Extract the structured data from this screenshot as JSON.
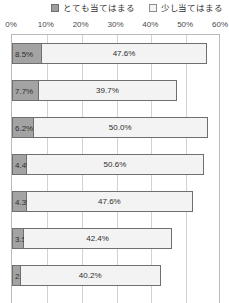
{
  "chart_data": {
    "type": "bar",
    "orientation": "horizontal",
    "stacked": true,
    "title": "",
    "subtitle": "",
    "xlabel": "",
    "ylabel": "",
    "xlim": [
      0,
      60
    ],
    "grid": true,
    "legend_position": "top-right",
    "categories": [
      "1",
      "2",
      "3",
      "4",
      "5",
      "6",
      "7"
    ],
    "tick_labels": [
      "0%",
      "10%",
      "20%",
      "30%",
      "40%",
      "50%",
      "60%"
    ],
    "tick_values": [
      0,
      10,
      20,
      30,
      40,
      50,
      60
    ],
    "series": [
      {
        "name": "とても当てはまる",
        "color": "#a3a3a3",
        "values": [
          8.5,
          7.7,
          6.2,
          4.4,
          4.3,
          3.5,
          2.5
        ],
        "labels": [
          "8.5%",
          "7.7%",
          "6.2%",
          "4.4%",
          "4.3%",
          "3.5%",
          "2.5%"
        ]
      },
      {
        "name": "少し当てはまる",
        "color": "#f3f3f3",
        "values": [
          47.6,
          39.7,
          50.0,
          50.6,
          47.6,
          42.4,
          40.2
        ],
        "labels": [
          "47.6%",
          "39.7%",
          "50.0%",
          "50.6%",
          "47.6%",
          "42.4%",
          "40.2%"
        ]
      }
    ]
  },
  "legend": {
    "items": [
      {
        "label": "とても当てはまる",
        "swatch": "filled-gray-square-icon"
      },
      {
        "label": "少し当てはまる",
        "swatch": "outline-white-square-icon"
      }
    ]
  }
}
